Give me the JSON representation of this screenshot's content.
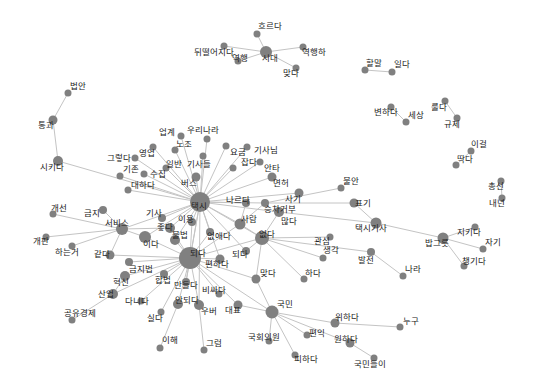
{
  "graph": {
    "type": "word-cooccurrence-network",
    "node_color": "#808080",
    "edge_color": "#c4c4c4",
    "label_color": "#222222",
    "nodes": [
      {
        "id": "시다",
        "x": 266,
        "y": 52,
        "r": 6,
        "label": "시대",
        "lx": 262,
        "ly": 61
      },
      {
        "id": "흐르다",
        "x": 257,
        "y": 34,
        "r": 3.5,
        "label": "흐르다",
        "lx": 258,
        "ly": 29
      },
      {
        "id": "뒤떨어지다",
        "x": 224,
        "y": 46,
        "r": 3.5,
        "label": "뒤떨어지다",
        "lx": 194,
        "ly": 55
      },
      {
        "id": "역행",
        "x": 238,
        "y": 61,
        "r": 3.5,
        "label": "역행",
        "lx": 232,
        "ly": 61
      },
      {
        "id": "역행하",
        "x": 303,
        "y": 47,
        "r": 3.5,
        "label": "역행하",
        "lx": 302,
        "ly": 55
      },
      {
        "id": "맞다1",
        "x": 296,
        "y": 68,
        "r": 3.5,
        "label": "맞다",
        "lx": 283,
        "ly": 76
      },
      {
        "id": "할말",
        "x": 365,
        "y": 70,
        "r": 3.5,
        "label": "할말",
        "lx": 366,
        "ly": 66
      },
      {
        "id": "일다",
        "x": 392,
        "y": 72,
        "r": 3.5,
        "label": "일다",
        "lx": 394,
        "ly": 67
      },
      {
        "id": "변하다",
        "x": 391,
        "y": 107,
        "r": 3.5,
        "label": "변하다",
        "lx": 374,
        "ly": 115
      },
      {
        "id": "세상",
        "x": 406,
        "y": 122,
        "r": 3.5,
        "label": "세상",
        "lx": 408,
        "ly": 118
      },
      {
        "id": "룰다",
        "x": 445,
        "y": 101,
        "r": 3.5,
        "label": "룰다",
        "lx": 431,
        "ly": 110
      },
      {
        "id": "규제",
        "x": 457,
        "y": 118,
        "r": 3.5,
        "label": "규제",
        "lx": 444,
        "ly": 127
      },
      {
        "id": "이걸",
        "x": 471,
        "y": 151,
        "r": 3.5,
        "label": "이걸",
        "lx": 471,
        "ly": 147
      },
      {
        "id": "딱다",
        "x": 456,
        "y": 165,
        "r": 3.5,
        "label": "딱다",
        "lx": 457,
        "ly": 162
      },
      {
        "id": "총선",
        "x": 501,
        "y": 181,
        "r": 3.5,
        "label": "총선",
        "lx": 488,
        "ly": 189
      },
      {
        "id": "내년",
        "x": 502,
        "y": 198,
        "r": 3.5,
        "label": "내년",
        "lx": 489,
        "ly": 206
      },
      {
        "id": "법안",
        "x": 68,
        "y": 93,
        "r": 3.5,
        "label": "법안",
        "lx": 70,
        "ly": 89
      },
      {
        "id": "통과",
        "x": 53,
        "y": 120,
        "r": 4.5,
        "label": "통과",
        "lx": 38,
        "ly": 128
      },
      {
        "id": "시키다",
        "x": 58,
        "y": 161,
        "r": 5,
        "label": "시키다",
        "lx": 40,
        "ly": 170
      },
      {
        "id": "택시",
        "x": 200,
        "y": 202,
        "r": 10,
        "label": "택시",
        "lx": 191,
        "ly": 209
      },
      {
        "id": "되다",
        "x": 190,
        "y": 258,
        "r": 11,
        "label": "되다",
        "lx": 190,
        "ly": 256
      },
      {
        "id": "없다",
        "x": 262,
        "y": 238,
        "r": 7,
        "label": "없다",
        "lx": 259,
        "ly": 237
      },
      {
        "id": "국민",
        "x": 272,
        "y": 312,
        "r": 6.5,
        "label": "국민",
        "lx": 277,
        "ly": 307
      },
      {
        "id": "서비스",
        "x": 122,
        "y": 229,
        "r": 6,
        "label": "서비스",
        "lx": 105,
        "ly": 226
      },
      {
        "id": "밥그릇",
        "x": 443,
        "y": 238,
        "r": 5.5,
        "label": "밥그릇",
        "lx": 425,
        "ly": 246
      },
      {
        "id": "택시기사",
        "x": 376,
        "y": 223,
        "r": 5.5,
        "label": "택시기사",
        "lx": 355,
        "ly": 231
      },
      {
        "id": "업계",
        "x": 181,
        "y": 136,
        "r": 3.5,
        "label": "업계",
        "lx": 159,
        "ly": 135
      },
      {
        "id": "우리나라",
        "x": 207,
        "y": 139,
        "r": 3.5,
        "label": "우리나라",
        "lx": 187,
        "ly": 133
      },
      {
        "id": "노조",
        "x": 175,
        "y": 150,
        "r": 3.5,
        "label": "노조",
        "lx": 176,
        "ly": 147
      },
      {
        "id": "영업",
        "x": 153,
        "y": 147,
        "r": 3.5,
        "label": "영업",
        "lx": 139,
        "ly": 156
      },
      {
        "id": "그렇다",
        "x": 135,
        "y": 158,
        "r": 3.5,
        "label": "그렇다",
        "lx": 107,
        "ly": 161
      },
      {
        "id": "일반",
        "x": 166,
        "y": 168,
        "r": 3.5,
        "label": "일반",
        "lx": 166,
        "ly": 167
      },
      {
        "id": "기사들",
        "x": 203,
        "y": 156,
        "r": 3.5,
        "label": "기사들",
        "lx": 187,
        "ly": 167
      },
      {
        "id": "기존",
        "x": 120,
        "y": 176,
        "r": 3.5,
        "label": "기존",
        "lx": 123,
        "ly": 172
      },
      {
        "id": "수집",
        "x": 144,
        "y": 174,
        "r": 3.5,
        "label": "수집",
        "lx": 150,
        "ly": 177
      },
      {
        "id": "대하다",
        "x": 128,
        "y": 190,
        "r": 3.5,
        "label": "대하다",
        "lx": 131,
        "ly": 188
      },
      {
        "id": "버스",
        "x": 196,
        "y": 177,
        "r": 4.5,
        "label": "버스",
        "lx": 181,
        "ly": 186
      },
      {
        "id": "요금",
        "x": 226,
        "y": 146,
        "r": 3.5,
        "label": "요금",
        "lx": 230,
        "ly": 155
      },
      {
        "id": "기사님",
        "x": 247,
        "y": 147,
        "r": 3.5,
        "label": "기사님",
        "lx": 254,
        "ly": 153
      },
      {
        "id": "잡다",
        "x": 233,
        "y": 168,
        "r": 3.5,
        "label": "잡다",
        "lx": 241,
        "ly": 165
      },
      {
        "id": "안타",
        "x": 260,
        "y": 162,
        "r": 3.5,
        "label": "안타",
        "lx": 264,
        "ly": 171
      },
      {
        "id": "면허",
        "x": 272,
        "y": 177,
        "r": 4.5,
        "label": "면허",
        "lx": 273,
        "ly": 186
      },
      {
        "id": "사기",
        "x": 299,
        "y": 193,
        "r": 4.5,
        "label": "사기",
        "lx": 285,
        "ly": 202
      },
      {
        "id": "나르다",
        "x": 246,
        "y": 203,
        "r": 4,
        "label": "나르다",
        "lx": 226,
        "ly": 203
      },
      {
        "id": "승차거부",
        "x": 265,
        "y": 203,
        "r": 4,
        "label": "승차거부",
        "lx": 264,
        "ly": 212
      },
      {
        "id": "많다",
        "x": 279,
        "y": 212,
        "r": 5,
        "label": "많다",
        "lx": 281,
        "ly": 224
      },
      {
        "id": "불안",
        "x": 341,
        "y": 188,
        "r": 3.5,
        "label": "불안",
        "lx": 343,
        "ly": 184
      },
      {
        "id": "표기",
        "x": 354,
        "y": 203,
        "r": 4.5,
        "label": "표기",
        "lx": 355,
        "ly": 206
      },
      {
        "id": "개선",
        "x": 53,
        "y": 214,
        "r": 3.5,
        "label": "개선",
        "lx": 51,
        "ly": 211
      },
      {
        "id": "금지",
        "x": 103,
        "y": 210,
        "r": 4,
        "label": "금지",
        "lx": 84,
        "ly": 216
      },
      {
        "id": "개판",
        "x": 46,
        "y": 237,
        "r": 3.5,
        "label": "개판",
        "lx": 33,
        "ly": 244
      },
      {
        "id": "하는거",
        "x": 72,
        "y": 246,
        "r": 3.5,
        "label": "하는거",
        "lx": 55,
        "ly": 255
      },
      {
        "id": "같다",
        "x": 110,
        "y": 255,
        "r": 4.5,
        "label": "같다",
        "lx": 94,
        "ly": 257
      },
      {
        "id": "기사",
        "x": 162,
        "y": 218,
        "r": 4,
        "label": "기사",
        "lx": 146,
        "ly": 216
      },
      {
        "id": "좋다",
        "x": 170,
        "y": 228,
        "r": 5,
        "label": "좋다",
        "lx": 157,
        "ly": 230
      },
      {
        "id": "이용",
        "x": 192,
        "y": 222,
        "r": 4,
        "label": "이용",
        "lx": 178,
        "ly": 222
      },
      {
        "id": "이다",
        "x": 145,
        "y": 237,
        "r": 6,
        "label": "이다",
        "lx": 143,
        "ly": 247
      },
      {
        "id": "불법",
        "x": 175,
        "y": 240,
        "r": 5,
        "label": "불법",
        "lx": 172,
        "ly": 238
      },
      {
        "id": "없애다",
        "x": 210,
        "y": 232,
        "r": 4,
        "label": "없애다",
        "lx": 207,
        "ly": 239
      },
      {
        "id": "사람",
        "x": 240,
        "y": 224,
        "r": 5.5,
        "label": "사람",
        "lx": 241,
        "ly": 222
      },
      {
        "id": "편하다",
        "x": 220,
        "y": 259,
        "r": 4.5,
        "label": "편하다",
        "lx": 205,
        "ly": 267
      },
      {
        "id": "되다2",
        "x": 246,
        "y": 251,
        "r": 4,
        "label": "되다",
        "lx": 232,
        "ly": 257
      },
      {
        "id": "관심",
        "x": 330,
        "y": 237,
        "r": 3.5,
        "label": "관심",
        "lx": 314,
        "ly": 244
      },
      {
        "id": "생각",
        "x": 323,
        "y": 258,
        "r": 3.5,
        "label": "생각",
        "lx": 323,
        "ly": 253
      },
      {
        "id": "발전",
        "x": 371,
        "y": 252,
        "r": 4,
        "label": "발전",
        "lx": 358,
        "ly": 263
      },
      {
        "id": "나라",
        "x": 403,
        "y": 276,
        "r": 3.5,
        "label": "나라",
        "lx": 405,
        "ly": 272
      },
      {
        "id": "맞다2",
        "x": 256,
        "y": 279,
        "r": 4.5,
        "label": "맞다",
        "lx": 260,
        "ly": 276
      },
      {
        "id": "하다",
        "x": 304,
        "y": 279,
        "r": 3.5,
        "label": "하다",
        "lx": 305,
        "ly": 276
      },
      {
        "id": "금지법",
        "x": 129,
        "y": 262,
        "r": 4,
        "label": "금지법",
        "lx": 129,
        "ly": 272
      },
      {
        "id": "합법",
        "x": 164,
        "y": 274,
        "r": 4,
        "label": "합법",
        "lx": 155,
        "ly": 283
      },
      {
        "id": "혁신",
        "x": 125,
        "y": 276,
        "r": 5,
        "label": "혁신",
        "lx": 113,
        "ly": 285
      },
      {
        "id": "산업",
        "x": 113,
        "y": 294,
        "r": 5,
        "label": "산업",
        "lx": 98,
        "ly": 297
      },
      {
        "id": "다니다",
        "x": 141,
        "y": 301,
        "r": 3.5,
        "label": "다니다",
        "lx": 125,
        "ly": 304
      },
      {
        "id": "공유경제",
        "x": 72,
        "y": 320,
        "r": 3.5,
        "label": "공유경제",
        "lx": 64,
        "ly": 316
      },
      {
        "id": "만들다",
        "x": 186,
        "y": 282,
        "r": 4,
        "label": "만들다",
        "lx": 174,
        "ly": 288
      },
      {
        "id": "안되다",
        "x": 178,
        "y": 304,
        "r": 5,
        "label": "안되다",
        "lx": 175,
        "ly": 303
      },
      {
        "id": "실다",
        "x": 161,
        "y": 312,
        "r": 3.5,
        "label": "실다",
        "lx": 147,
        "ly": 321
      },
      {
        "id": "비싸다",
        "x": 219,
        "y": 294,
        "r": 3.5,
        "label": "비싸다",
        "lx": 202,
        "ly": 293
      },
      {
        "id": "우버",
        "x": 199,
        "y": 305,
        "r": 5,
        "label": "우버",
        "lx": 201,
        "ly": 314
      },
      {
        "id": "대표",
        "x": 238,
        "y": 305,
        "r": 4.5,
        "label": "대표",
        "lx": 225,
        "ly": 313
      },
      {
        "id": "이해",
        "x": 160,
        "y": 348,
        "r": 3.5,
        "label": "이해",
        "lx": 162,
        "ly": 343
      },
      {
        "id": "그럼",
        "x": 204,
        "y": 350,
        "r": 3.5,
        "label": "그럼",
        "lx": 206,
        "ly": 346
      },
      {
        "id": "국회의원",
        "x": 269,
        "y": 341,
        "r": 3.5,
        "label": "국회의원",
        "lx": 248,
        "ly": 340
      },
      {
        "id": "편익",
        "x": 307,
        "y": 335,
        "r": 3.5,
        "label": "편익",
        "lx": 309,
        "ly": 336
      },
      {
        "id": "위하다",
        "x": 335,
        "y": 323,
        "r": 4.5,
        "label": "위하다",
        "lx": 335,
        "ly": 320
      },
      {
        "id": "원하다",
        "x": 350,
        "y": 343,
        "r": 4.5,
        "label": "원하다",
        "lx": 334,
        "ly": 342
      },
      {
        "id": "피하다",
        "x": 295,
        "y": 355,
        "r": 3.5,
        "label": "피하다",
        "lx": 294,
        "ly": 362
      },
      {
        "id": "누구",
        "x": 400,
        "y": 327,
        "r": 3.5,
        "label": "누구",
        "lx": 403,
        "ly": 324
      },
      {
        "id": "국민들이",
        "x": 374,
        "y": 358,
        "r": 3.5,
        "label": "국민들이",
        "lx": 354,
        "ly": 367
      },
      {
        "id": "지키다",
        "x": 475,
        "y": 227,
        "r": 3.5,
        "label": "지키다",
        "lx": 457,
        "ly": 235
      },
      {
        "id": "자기",
        "x": 483,
        "y": 249,
        "r": 3.5,
        "label": "자기",
        "lx": 485,
        "ly": 245
      },
      {
        "id": "챙기다",
        "x": 464,
        "y": 266,
        "r": 3.5,
        "label": "챙기다",
        "lx": 462,
        "ly": 264
      }
    ],
    "edges": [
      [
        "시다",
        "흐르다"
      ],
      [
        "시다",
        "뒤떨어지다"
      ],
      [
        "시다",
        "역행"
      ],
      [
        "시다",
        "역행하"
      ],
      [
        "시다",
        "맞다1"
      ],
      [
        "할말",
        "일다"
      ],
      [
        "변하다",
        "세상"
      ],
      [
        "룰다",
        "규제"
      ],
      [
        "이걸",
        "딱다"
      ],
      [
        "총선",
        "내년"
      ],
      [
        "법안",
        "통과"
      ],
      [
        "통과",
        "시키다"
      ],
      [
        "시키다",
        "택시"
      ],
      [
        "택시",
        "업계"
      ],
      [
        "택시",
        "우리나라"
      ],
      [
        "택시",
        "노조"
      ],
      [
        "택시",
        "영업"
      ],
      [
        "택시",
        "그렇다"
      ],
      [
        "택시",
        "일반"
      ],
      [
        "택시",
        "기사들"
      ],
      [
        "택시",
        "기존"
      ],
      [
        "택시",
        "수집"
      ],
      [
        "택시",
        "대하다"
      ],
      [
        "택시",
        "버스"
      ],
      [
        "택시",
        "요금"
      ],
      [
        "택시",
        "기사님"
      ],
      [
        "택시",
        "잡다"
      ],
      [
        "택시",
        "안타"
      ],
      [
        "택시",
        "면허"
      ],
      [
        "택시",
        "나르다"
      ],
      [
        "택시",
        "승차거부"
      ],
      [
        "택시",
        "사기"
      ],
      [
        "택시",
        "많다"
      ],
      [
        "택시",
        "서비스"
      ],
      [
        "택시",
        "기사"
      ],
      [
        "택시",
        "좋다"
      ],
      [
        "택시",
        "이용"
      ],
      [
        "택시",
        "이다"
      ],
      [
        "택시",
        "불법"
      ],
      [
        "택시",
        "없애다"
      ],
      [
        "택시",
        "사람"
      ],
      [
        "택시",
        "되다"
      ],
      [
        "택시",
        "편하다"
      ],
      [
        "택시",
        "되다2"
      ],
      [
        "택시",
        "없다"
      ],
      [
        "택시",
        "우버"
      ],
      [
        "택시",
        "만들다"
      ],
      [
        "승차거부",
        "불안"
      ],
      [
        "승차거부",
        "표기"
      ],
      [
        "많다",
        "택시기사"
      ],
      [
        "표기",
        "택시기사"
      ],
      [
        "택시기사",
        "밥그릇"
      ],
      [
        "밥그릇",
        "지키다"
      ],
      [
        "밥그릇",
        "자기"
      ],
      [
        "밥그릇",
        "챙기다"
      ],
      [
        "서비스",
        "개선"
      ],
      [
        "서비스",
        "금지"
      ],
      [
        "서비스",
        "개판"
      ],
      [
        "서비스",
        "하는거"
      ],
      [
        "서비스",
        "같다"
      ],
      [
        "서비스",
        "이다"
      ],
      [
        "서비스",
        "좋다"
      ],
      [
        "되다",
        "이다"
      ],
      [
        "되다",
        "불법"
      ],
      [
        "되다",
        "좋다"
      ],
      [
        "되다",
        "이용"
      ],
      [
        "되다",
        "없애다"
      ],
      [
        "되다",
        "사람"
      ],
      [
        "되다",
        "편하다"
      ],
      [
        "되다",
        "금지법"
      ],
      [
        "되다",
        "합법"
      ],
      [
        "되다",
        "혁신"
      ],
      [
        "되다",
        "산업"
      ],
      [
        "되다",
        "만들다"
      ],
      [
        "되다",
        "안되다"
      ],
      [
        "되다",
        "실다"
      ],
      [
        "되다",
        "비싸다"
      ],
      [
        "되다",
        "우버"
      ],
      [
        "되다",
        "대표"
      ],
      [
        "되다",
        "국민"
      ],
      [
        "되다",
        "없다"
      ],
      [
        "되다",
        "같다"
      ],
      [
        "되다",
        "맞다2"
      ],
      [
        "되다",
        "다니다"
      ],
      [
        "산업",
        "공유경제"
      ],
      [
        "혁신",
        "산업"
      ],
      [
        "안되다",
        "이해"
      ],
      [
        "우버",
        "그럼"
      ],
      [
        "없다",
        "사람"
      ],
      [
        "없다",
        "많다"
      ],
      [
        "없다",
        "관심"
      ],
      [
        "없다",
        "생각"
      ],
      [
        "없다",
        "발전"
      ],
      [
        "없다",
        "하다"
      ],
      [
        "없다",
        "맞다2"
      ],
      [
        "없다",
        "되다2"
      ],
      [
        "발전",
        "나라"
      ],
      [
        "사람",
        "승차거부"
      ],
      [
        "사람",
        "나르다"
      ],
      [
        "국민",
        "대표"
      ],
      [
        "국민",
        "국회의원"
      ],
      [
        "국민",
        "피하다"
      ],
      [
        "국민",
        "편익"
      ],
      [
        "국민",
        "위하다"
      ],
      [
        "국민",
        "원하다"
      ],
      [
        "국민",
        "맞다2"
      ],
      [
        "위하다",
        "누구"
      ],
      [
        "원하다",
        "국민들이"
      ]
    ]
  }
}
